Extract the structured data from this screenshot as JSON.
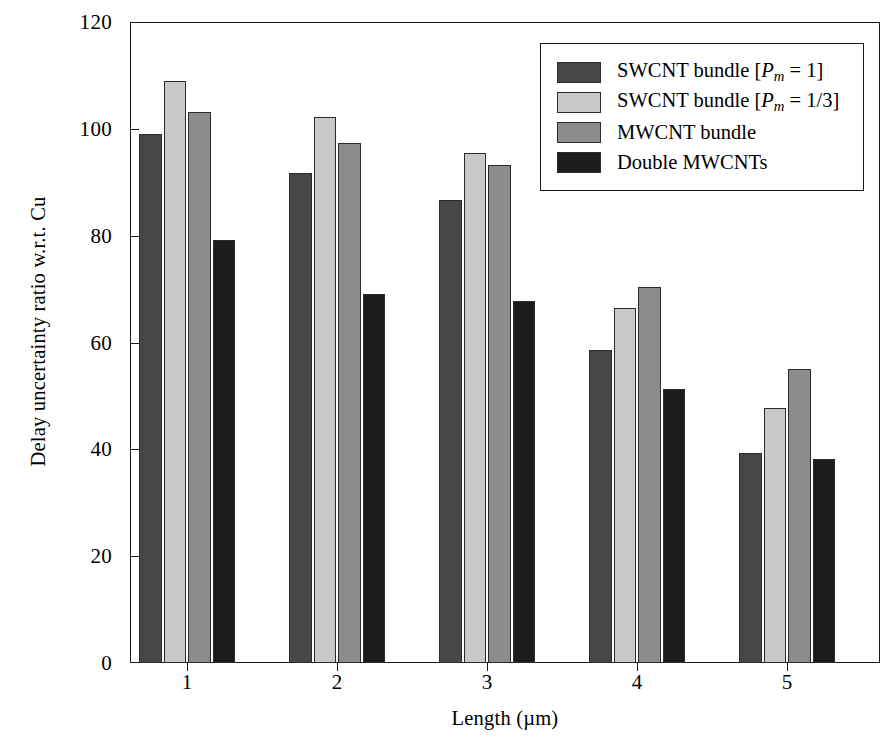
{
  "chart_data": {
    "type": "bar",
    "title": "",
    "xlabel": "Length (µm)",
    "ylabel": "Delay uncertainty ratio w.r.t. Cu",
    "categories": [
      "1",
      "2",
      "3",
      "4",
      "5"
    ],
    "ylim": [
      0,
      120
    ],
    "yticks": [
      0,
      20,
      40,
      60,
      80,
      100,
      120
    ],
    "ytick_labels": [
      "0",
      "20",
      "40",
      "60",
      "80",
      "100",
      "120"
    ],
    "grid": false,
    "legend_position": "top-right",
    "series": [
      {
        "name": "SWCNT bundle [Pm = 1]",
        "color": "#474747",
        "values": [
          99.0,
          91.7,
          86.6,
          58.6,
          39.4
        ]
      },
      {
        "name": "SWCNT bundle [Pm = 1/3]",
        "color": "#c9c9c9",
        "values": [
          108.9,
          102.2,
          95.4,
          66.5,
          47.7
        ]
      },
      {
        "name": "MWCNT bundle",
        "color": "#8c8c8c",
        "values": [
          103.2,
          97.4,
          93.2,
          70.4,
          55.0
        ]
      },
      {
        "name": "Double MWCNTs",
        "color": "#1c1c1c",
        "values": [
          79.2,
          69.1,
          67.7,
          51.3,
          38.1
        ]
      }
    ]
  },
  "legend": {
    "items": [
      {
        "label_prefix": "SWCNT bundle [",
        "label_var": "P",
        "label_sub": "m",
        "label_suffix": " = 1]",
        "color": "#474747"
      },
      {
        "label_prefix": "SWCNT bundle [",
        "label_var": "P",
        "label_sub": "m",
        "label_suffix": " = 1/3]",
        "color": "#c9c9c9"
      },
      {
        "label_prefix": "MWCNT bundle",
        "label_var": "",
        "label_sub": "",
        "label_suffix": "",
        "color": "#8c8c8c"
      },
      {
        "label_prefix": "Double MWCNTs",
        "label_var": "",
        "label_sub": "",
        "label_suffix": "",
        "color": "#1c1c1c"
      }
    ]
  },
  "axes": {
    "frame_color": "#1a1a1a",
    "background": "#ffffff"
  }
}
